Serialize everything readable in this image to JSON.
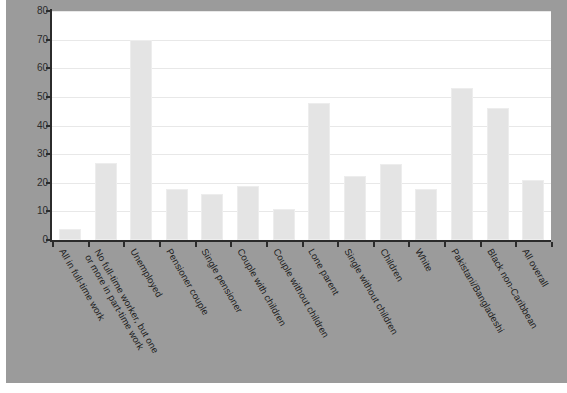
{
  "chart_data": {
    "type": "bar",
    "title": "",
    "xlabel": "",
    "ylabel": "",
    "ylim": [
      0,
      80
    ],
    "y_ticks": [
      0,
      10,
      20,
      30,
      40,
      50,
      60,
      70,
      80
    ],
    "grid": true,
    "legend": "none",
    "categories": [
      "All in full-time work",
      "No full-time worker, but one or more in part-time work",
      "Unemployed",
      "Pensioner couple",
      "Single pensioner",
      "Couple with children",
      "Couple without children",
      "Lone parent",
      "Single without children",
      "Children",
      "White",
      "Pakistani/Bangladeshi",
      "Black non-Caribbean",
      "All overall"
    ],
    "category_lines": [
      [
        "All in full-time work"
      ],
      [
        "No full-time worker, but one",
        "or more in part-time work"
      ],
      [
        "Unemployed"
      ],
      [
        "Pensioner couple"
      ],
      [
        "Single pensioner"
      ],
      [
        "Couple with children"
      ],
      [
        "Couple without children"
      ],
      [
        "Lone parent"
      ],
      [
        "Single without children"
      ],
      [
        "Children"
      ],
      [
        "White"
      ],
      [
        "Pakistani/Bangladeshi"
      ],
      [
        "Black non-Caribbean"
      ],
      [
        "All overall"
      ]
    ],
    "values": [
      4,
      27,
      70,
      18,
      16,
      19,
      11,
      48,
      22.5,
      26.5,
      18,
      53,
      46,
      21
    ]
  },
  "colors": {
    "panel_background": "#9b9b9b",
    "plot_background": "#ffffff",
    "bar_fill": "#e4e4e4",
    "bar_border": "#ededed",
    "gridline": "#e8e8e8",
    "axis": "#2b2b2b",
    "tick_text": "#2b2b2b",
    "category_text": "#1c1c1c"
  }
}
